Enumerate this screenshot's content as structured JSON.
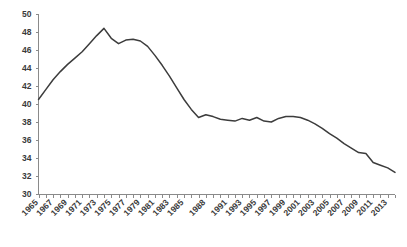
{
  "chart_data": {
    "type": "line",
    "title": "",
    "subtitle": "",
    "xlabel": "",
    "ylabel": "",
    "grid": false,
    "legend": "none",
    "xlim": [
      1965,
      2014
    ],
    "ylim": [
      30,
      50
    ],
    "ytick_step": 2,
    "xtick_step": 1,
    "xtick_label_step": 2,
    "line_color": "#3c3c3c",
    "axis_color": "#8a8a8a",
    "tick_label_color": "#3a3a3a",
    "ytick_labels": [
      "30",
      "32",
      "34",
      "36",
      "38",
      "40",
      "42",
      "44",
      "46",
      "48",
      "50"
    ],
    "ytick_values": [
      30,
      32,
      34,
      36,
      38,
      40,
      42,
      44,
      46,
      48,
      50
    ],
    "xtick_labels": [
      "1965",
      "1967",
      "1969",
      "1971",
      "1973",
      "1975",
      "1977",
      "1979",
      "1981",
      "1983",
      "1985",
      "1988",
      "1991",
      "1993",
      "1995",
      "1997",
      "1999",
      "2001",
      "2003",
      "2005",
      "2007",
      "2009",
      "2011",
      "2013"
    ],
    "x": [
      1965,
      1966,
      1967,
      1968,
      1969,
      1970,
      1971,
      1972,
      1973,
      1974,
      1975,
      1976,
      1977,
      1978,
      1979,
      1980,
      1981,
      1982,
      1983,
      1984,
      1985,
      1986,
      1987,
      1988,
      1989,
      1990,
      1991,
      1992,
      1993,
      1994,
      1995,
      1996,
      1997,
      1998,
      1999,
      2000,
      2001,
      2002,
      2003,
      2004,
      2005,
      2006,
      2007,
      2008,
      2009,
      2010,
      2011,
      2012,
      2013,
      2014
    ],
    "categories": [
      "1965",
      "1966",
      "1967",
      "1968",
      "1969",
      "1970",
      "1971",
      "1972",
      "1973",
      "1974",
      "1975",
      "1976",
      "1977",
      "1978",
      "1979",
      "1980",
      "1981",
      "1982",
      "1983",
      "1984",
      "1985",
      "1986",
      "1987",
      "1988",
      "1989",
      "1990",
      "1991",
      "1992",
      "1993",
      "1994",
      "1995",
      "1996",
      "1997",
      "1998",
      "1999",
      "2000",
      "2001",
      "2002",
      "2003",
      "2004",
      "2005",
      "2006",
      "2007",
      "2008",
      "2009",
      "2010",
      "2011",
      "2012",
      "2013",
      "2014"
    ],
    "values": [
      40.5,
      41.6,
      42.7,
      43.6,
      44.4,
      45.1,
      45.8,
      46.7,
      47.6,
      48.4,
      47.3,
      46.7,
      47.1,
      47.2,
      47.0,
      46.4,
      45.4,
      44.3,
      43.1,
      41.8,
      40.5,
      39.4,
      38.5,
      38.8,
      38.6,
      38.3,
      38.2,
      38.1,
      38.4,
      38.2,
      38.5,
      38.1,
      38.0,
      38.4,
      38.6,
      38.6,
      38.5,
      38.2,
      37.8,
      37.3,
      36.7,
      36.2,
      35.6,
      35.1,
      34.6,
      34.5,
      33.5,
      33.2,
      32.9,
      32.4
    ],
    "series": [
      {
        "name": "series-1",
        "values": [
          40.5,
          41.6,
          42.7,
          43.6,
          44.4,
          45.1,
          45.8,
          46.7,
          47.6,
          48.4,
          47.3,
          46.7,
          47.1,
          47.2,
          47.0,
          46.4,
          45.4,
          44.3,
          43.1,
          41.8,
          40.5,
          39.4,
          38.5,
          38.8,
          38.6,
          38.3,
          38.2,
          38.1,
          38.4,
          38.2,
          38.5,
          38.1,
          38.0,
          38.4,
          38.6,
          38.6,
          38.5,
          38.2,
          37.8,
          37.3,
          36.7,
          36.2,
          35.6,
          35.1,
          34.6,
          34.5,
          33.5,
          33.2,
          32.9,
          32.4
        ]
      }
    ]
  }
}
